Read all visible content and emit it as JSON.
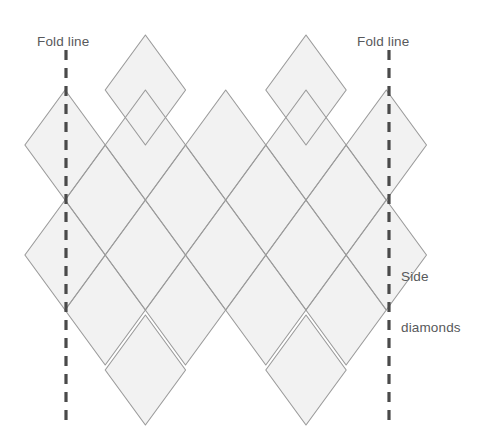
{
  "figure": {
    "type": "diagram"
  },
  "labels": {
    "fold_line_left": "Fold line",
    "fold_line_right": "Fold line",
    "side_diamonds_line1": "Side",
    "side_diamonds_line2": "diamonds"
  },
  "colors": {
    "background": "#ffffff",
    "diamond_fill": "#f2f2f2",
    "diamond_stroke": "#9b9b9b",
    "fold_line": "#4a4a4a",
    "label_text": "#58595b"
  },
  "geometry": {
    "canvas_width": 478,
    "canvas_height": 448,
    "half_width": 40.2,
    "half_height": 55,
    "grid_origin_x": 25,
    "grid_origin_y": 200,
    "columns": 5,
    "rows": 4,
    "fold_line_left_x": 66,
    "fold_line_right_x": 389,
    "fold_line_top_y": 50,
    "fold_line_bottom_y": 424,
    "fold_dash_length": 10,
    "fold_dash_gap": 8,
    "fold_stroke_width": 3.2,
    "diamond_stroke_width": 1.1
  },
  "chart_data": {
    "type": "diagram",
    "diamond_centers": [
      {
        "row": 0,
        "cx": 145.4,
        "cy": 90,
        "label": "top-row-diamond-1"
      },
      {
        "row": 0,
        "cx": 306.0,
        "cy": 90,
        "label": "top-row-diamond-2"
      },
      {
        "row": 1,
        "cx": 65.1,
        "cy": 145,
        "label": "row1-diamond-1"
      },
      {
        "row": 1,
        "cx": 145.4,
        "cy": 145,
        "label": "row1-diamond-2"
      },
      {
        "row": 1,
        "cx": 225.7,
        "cy": 145,
        "label": "row1-diamond-3"
      },
      {
        "row": 1,
        "cx": 306.0,
        "cy": 145,
        "label": "row1-diamond-4"
      },
      {
        "row": 1,
        "cx": 386.3,
        "cy": 145,
        "label": "row1-diamond-5"
      },
      {
        "row": 2,
        "cx": 105.2,
        "cy": 200,
        "label": "row2-diamond-1"
      },
      {
        "row": 2,
        "cx": 185.5,
        "cy": 200,
        "label": "row2-diamond-2"
      },
      {
        "row": 2,
        "cx": 265.8,
        "cy": 200,
        "label": "row2-diamond-3"
      },
      {
        "row": 2,
        "cx": 346.1,
        "cy": 200,
        "label": "row2-diamond-4"
      },
      {
        "row": 3,
        "cx": 65.1,
        "cy": 255,
        "label": "row3-diamond-1"
      },
      {
        "row": 3,
        "cx": 145.4,
        "cy": 255,
        "label": "row3-diamond-2"
      },
      {
        "row": 3,
        "cx": 225.7,
        "cy": 255,
        "label": "row3-diamond-3"
      },
      {
        "row": 3,
        "cx": 306.0,
        "cy": 255,
        "label": "row3-diamond-4"
      },
      {
        "row": 3,
        "cx": 386.3,
        "cy": 255,
        "label": "row3-diamond-5"
      },
      {
        "row": 4,
        "cx": 105.2,
        "cy": 310,
        "label": "row4-diamond-1"
      },
      {
        "row": 4,
        "cx": 185.5,
        "cy": 310,
        "label": "row4-diamond-2"
      },
      {
        "row": 4,
        "cx": 265.8,
        "cy": 310,
        "label": "row4-diamond-3"
      },
      {
        "row": 4,
        "cx": 346.1,
        "cy": 310,
        "label": "row4-diamond-4"
      },
      {
        "row": 5,
        "cx": 145.4,
        "cy": 370,
        "label": "bottom-row-diamond-1"
      },
      {
        "row": 5,
        "cx": 306.0,
        "cy": 370,
        "label": "bottom-row-diamond-2"
      }
    ],
    "fold_lines": [
      {
        "name": "left-fold-line",
        "x": 66,
        "y_top": 50,
        "y_bottom": 424,
        "style": "dashed"
      },
      {
        "name": "right-fold-line",
        "x": 389,
        "y_top": 50,
        "y_bottom": 424,
        "style": "dashed"
      }
    ],
    "annotations": [
      {
        "text": "Fold line",
        "x": 37,
        "y": 33,
        "anchor": "left-fold-line"
      },
      {
        "text": "Fold line",
        "x": 357,
        "y": 33,
        "anchor": "right-fold-line"
      },
      {
        "text": "Side diamonds",
        "x": 401,
        "y": 234,
        "anchor": "right-side-diamonds"
      }
    ]
  }
}
